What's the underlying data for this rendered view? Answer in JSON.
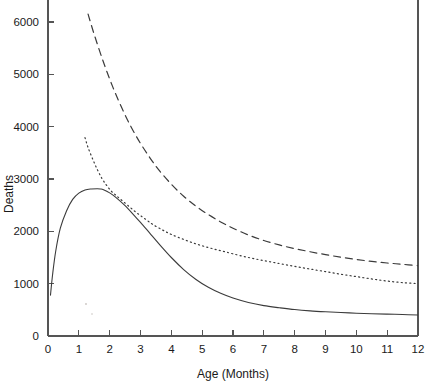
{
  "chart_data": {
    "type": "line",
    "title": "",
    "subtitle": "",
    "xlabel": "Age (Months)",
    "ylabel": "Deaths",
    "xlim": [
      0,
      12
    ],
    "ylim": [
      0,
      6400
    ],
    "xticks": [
      0,
      1,
      2,
      3,
      4,
      5,
      6,
      7,
      8,
      9,
      10,
      11,
      12
    ],
    "xtick_labels": [
      "0",
      "1",
      "2",
      "3",
      "4",
      "5",
      "6",
      "7",
      "8",
      "9",
      "10",
      "11",
      "12"
    ],
    "yticks": [
      0,
      1000,
      2000,
      3000,
      4000,
      5000,
      6000
    ],
    "ytick_labels": [
      "0",
      "1000",
      "2000",
      "3000",
      "4000",
      "5000",
      "6000"
    ],
    "grid": false,
    "legend": null,
    "legend_position": "none",
    "annotations": [],
    "series": [
      {
        "name": "solid-curve",
        "style": "solid",
        "color": "#3b3b3b",
        "x": [
          0.08,
          0.15,
          0.25,
          0.4,
          0.6,
          0.8,
          1.0,
          1.2,
          1.4,
          1.6,
          1.7,
          1.8,
          2.0,
          2.2,
          2.5,
          2.8,
          3.0,
          3.3,
          3.6,
          4.0,
          4.4,
          4.8,
          5.2,
          5.6,
          6.0,
          6.5,
          7.0,
          7.5,
          8.0,
          8.5,
          9.0,
          9.5,
          10.0,
          10.5,
          11.0,
          11.5,
          12.0
        ],
        "y": [
          780,
          1180,
          1620,
          2060,
          2390,
          2610,
          2730,
          2790,
          2810,
          2815,
          2810,
          2795,
          2735,
          2650,
          2490,
          2300,
          2170,
          1965,
          1760,
          1500,
          1270,
          1080,
          930,
          815,
          725,
          640,
          580,
          540,
          505,
          480,
          462,
          448,
          436,
          426,
          418,
          410,
          400
        ]
      },
      {
        "name": "dotted-curve",
        "style": "dotted",
        "color": "#3b3b3b",
        "x": [
          1.2,
          1.3,
          1.45,
          1.6,
          1.75,
          1.9,
          2.05,
          2.2,
          2.4,
          2.6,
          2.8,
          3.0,
          3.2,
          3.4,
          3.7,
          4.0,
          4.4,
          4.8,
          5.2,
          5.6,
          6.0,
          6.5,
          7.0,
          7.5,
          8.0,
          8.5,
          9.0,
          9.5,
          10.0,
          10.5,
          11.0,
          11.5,
          12.0
        ],
        "y": [
          3790,
          3600,
          3380,
          3180,
          3010,
          2880,
          2770,
          2690,
          2590,
          2490,
          2390,
          2300,
          2215,
          2130,
          2030,
          1940,
          1845,
          1760,
          1690,
          1630,
          1570,
          1500,
          1440,
          1385,
          1330,
          1280,
          1230,
          1180,
          1135,
          1090,
          1050,
          1020,
          1000
        ]
      },
      {
        "name": "dashed-curve",
        "style": "dashed",
        "color": "#3b3b3b",
        "x": [
          1.3,
          1.5,
          1.8,
          2.1,
          2.4,
          2.7,
          3.0,
          3.3,
          3.6,
          4.0,
          4.4,
          4.8,
          5.2,
          5.6,
          6.0,
          6.5,
          7.0,
          7.5,
          8.0,
          8.5,
          9.0,
          9.5,
          10.0,
          10.5,
          11.0,
          11.5,
          12.0
        ],
        "y": [
          6150,
          5760,
          5230,
          4760,
          4350,
          3990,
          3680,
          3410,
          3170,
          2900,
          2670,
          2480,
          2320,
          2180,
          2060,
          1930,
          1825,
          1740,
          1670,
          1610,
          1555,
          1505,
          1462,
          1425,
          1395,
          1370,
          1345
        ]
      }
    ]
  },
  "axes": {
    "y_axis_label": "Deaths",
    "x_axis_label": "Age (Months)"
  }
}
